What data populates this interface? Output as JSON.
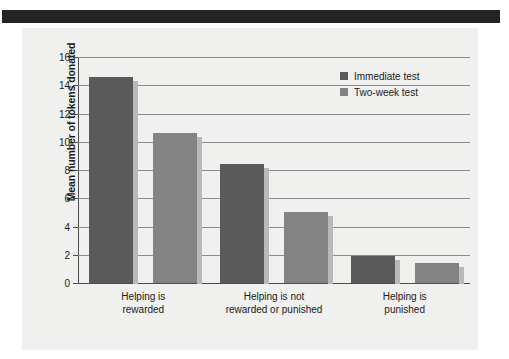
{
  "figure": {
    "background_color": "#f0f0ee",
    "top_band_color": "#242424"
  },
  "chart_data": {
    "type": "bar",
    "title": "",
    "xlabel": "",
    "ylabel": "Mean number of tokens donated",
    "ylim": [
      0,
      16
    ],
    "yticks": [
      0,
      2,
      4,
      6,
      8,
      10,
      12,
      14,
      16
    ],
    "ytick_labels": [
      "0",
      "2",
      "4",
      "6",
      "8",
      "10",
      "12",
      "14",
      "16"
    ],
    "grid": true,
    "legend_position": "top-right",
    "categories": [
      "Helping is rewarded",
      "Helping is not rewarded or punished",
      "Helping is punished"
    ],
    "category_lines": [
      [
        "Helping is",
        "rewarded"
      ],
      [
        "Helping is not",
        "rewarded or punished"
      ],
      [
        "Helping is",
        "punished"
      ]
    ],
    "series": [
      {
        "name": "Immediate test",
        "color": "#5a5a5a",
        "values": [
          14.6,
          8.4,
          1.9
        ]
      },
      {
        "name": "Two-week test",
        "color": "#838383",
        "values": [
          10.6,
          5.0,
          1.45
        ]
      }
    ]
  }
}
